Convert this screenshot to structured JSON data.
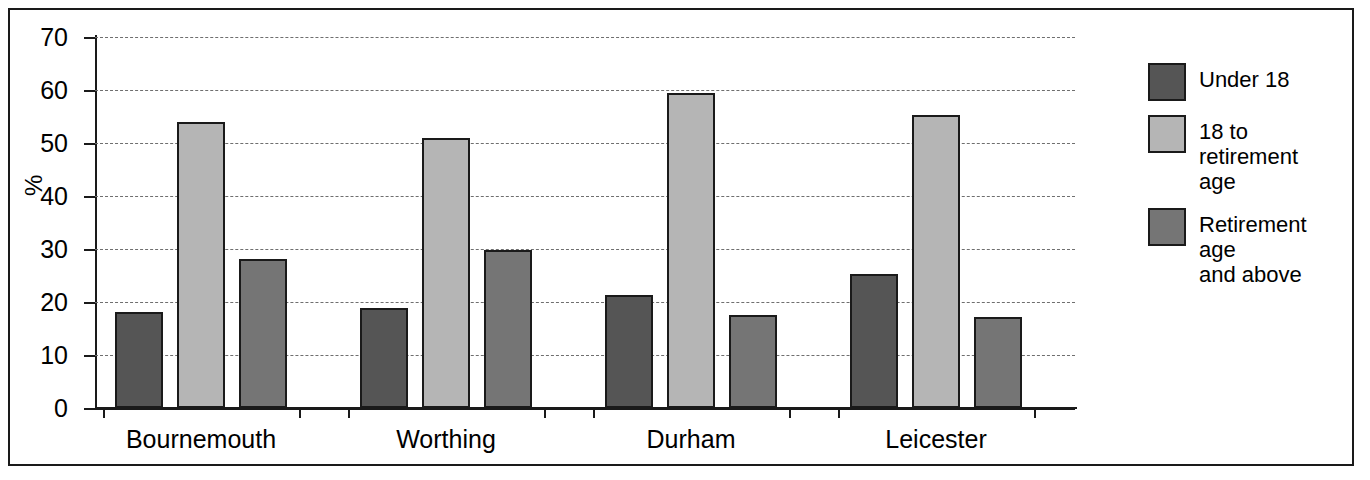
{
  "chart_data": {
    "type": "bar",
    "title": "",
    "xlabel": "",
    "ylabel": "%",
    "ylim": [
      0,
      70
    ],
    "ytick_labels": [
      "0",
      "10",
      "20",
      "30",
      "40",
      "50",
      "60",
      "70"
    ],
    "ytick_values": [
      0,
      10,
      20,
      30,
      40,
      50,
      60,
      70
    ],
    "grid": true,
    "grid_style": "dashed-horizontal",
    "legend_position": "right",
    "categories": [
      "Bournemouth",
      "Worthing",
      "Durham",
      "Leicester"
    ],
    "series": [
      {
        "name": "Under 18",
        "color": "#555555",
        "values": [
          18.2,
          18.8,
          21.4,
          25.3
        ]
      },
      {
        "name": "18 to retirement\nage",
        "legend_text": "18 to retirement age",
        "color": "#b5b5b5",
        "values": [
          54.0,
          51.0,
          59.5,
          55.3
        ]
      },
      {
        "name": "Retirement age\nand above",
        "legend_text": "Retirement age and above",
        "color": "#757575",
        "values": [
          28.2,
          29.8,
          17.5,
          17.1
        ]
      }
    ]
  },
  "legend": {
    "items": [
      {
        "label": "Under 18",
        "color": "#555555"
      },
      {
        "label": "18 to retirement\nage",
        "color": "#b5b5b5"
      },
      {
        "label": "Retirement age\nand above",
        "color": "#757575"
      }
    ]
  },
  "axis": {
    "y_title": "%"
  },
  "colors": {
    "series_under_18": "#555555",
    "series_working_age": "#b5b5b5",
    "series_retired": "#757575",
    "axis": "#1a1a1a",
    "grid": "#6f6f6f",
    "background": "#ffffff"
  }
}
